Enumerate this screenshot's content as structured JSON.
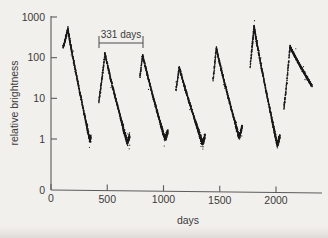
{
  "chart_data": {
    "type": "scatter",
    "title": "",
    "xlabel": "days",
    "ylabel": "relative brightness",
    "xlim": [
      0,
      2320
    ],
    "ylim": [
      0.55,
      1000
    ],
    "yscale": "log",
    "xscale": "linear",
    "grid": false,
    "legend": null,
    "xticks": [
      0,
      500,
      1000,
      1500,
      2000
    ],
    "xticklabels": [
      "0",
      "500",
      "1000",
      "1500",
      "2000"
    ],
    "yticks": [
      1,
      10,
      100,
      1000
    ],
    "yticklabels": [
      "1",
      "10",
      "100",
      "1000"
    ],
    "y_origin_label": "0",
    "annotations": [
      {
        "name": "period-bracket",
        "text": "331 days",
        "x_start": 430,
        "x_end": 820,
        "value": 331,
        "unit": "days"
      }
    ],
    "series": [
      {
        "name": "relative brightness",
        "marker": "dot",
        "color": "#1a1a1a",
        "period_days": 331,
        "cycles": [
          {
            "peak_day": 150,
            "peak_value": 520,
            "min_day": 345,
            "min_value": 0.95
          },
          {
            "peak_day": 480,
            "peak_value": 130,
            "min_day": 675,
            "min_value": 0.85
          },
          {
            "peak_day": 815,
            "peak_value": 120,
            "min_day": 1010,
            "min_value": 1.05
          },
          {
            "peak_day": 1140,
            "peak_value": 60,
            "min_day": 1345,
            "min_value": 0.8
          },
          {
            "peak_day": 1470,
            "peak_value": 175,
            "min_day": 1670,
            "min_value": 1.15
          },
          {
            "peak_day": 1805,
            "peak_value": 600,
            "min_day": 2010,
            "min_value": 0.75
          },
          {
            "peak_day": 2125,
            "peak_value": 190,
            "min_day": 2320,
            "min_value": 20
          }
        ]
      }
    ]
  }
}
